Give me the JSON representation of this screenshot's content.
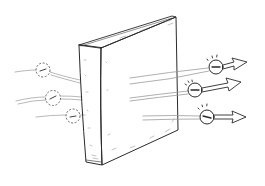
{
  "figure": {
    "title": "Quantum tunneling of electrons through a barrier",
    "barrier": {
      "label": "barrier"
    },
    "incoming_particles": [
      {
        "symbol": "−",
        "state": "dashed",
        "cx": 43,
        "cy": 70,
        "r": 7
      },
      {
        "symbol": "−",
        "state": "dashed",
        "cx": 53,
        "cy": 98,
        "r": 7.5
      },
      {
        "symbol": "−",
        "state": "dashed",
        "cx": 73,
        "cy": 116,
        "r": 7
      }
    ],
    "outgoing_particles": [
      {
        "symbol": "−",
        "state": "solid",
        "cx": 216,
        "cy": 67,
        "r": 7
      },
      {
        "symbol": "−",
        "state": "solid",
        "cx": 195,
        "cy": 90,
        "r": 7
      },
      {
        "symbol": "−",
        "state": "solid",
        "cx": 207,
        "cy": 117,
        "r": 7
      }
    ],
    "colors": {
      "ink": "#2a2a2a",
      "arrow_fill": "#8c8c8c",
      "background": "#ffffff",
      "faint_line": "#9a9a9a"
    }
  }
}
